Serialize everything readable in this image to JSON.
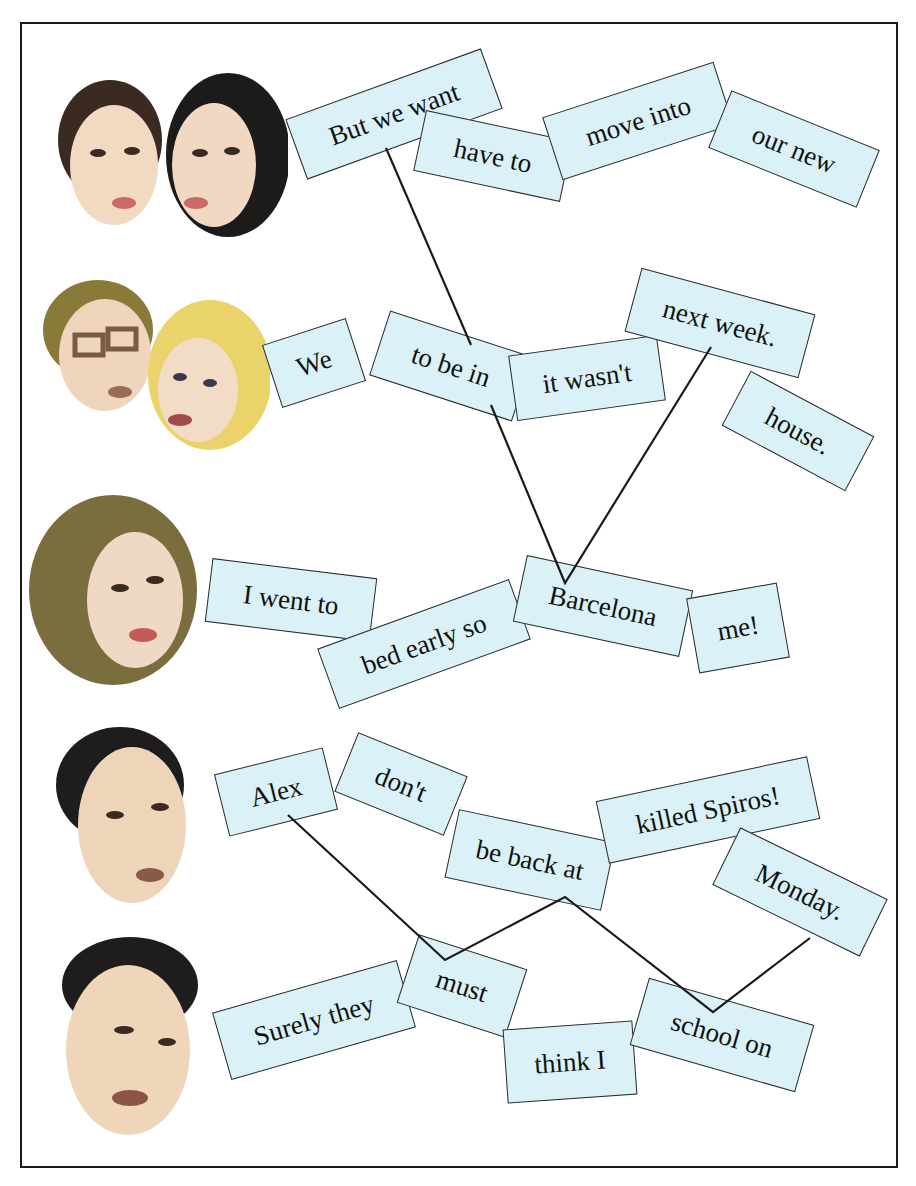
{
  "exercise": {
    "background_color": "#ffffff",
    "card_color": "#daf1f7",
    "line_color": "#1a1a1a"
  },
  "rows": [
    {
      "speakers": "two-people-dark-hair",
      "cards": [
        {
          "text": "But we want",
          "x": 290,
          "y": 82,
          "w": 208,
          "h": 64,
          "rot": -20
        },
        {
          "text": "have to",
          "x": 418,
          "y": 125,
          "w": 150,
          "h": 62,
          "rot": 12
        },
        {
          "text": "move into",
          "x": 548,
          "y": 88,
          "w": 180,
          "h": 66,
          "rot": -18
        },
        {
          "text": "our new",
          "x": 714,
          "y": 118,
          "w": 160,
          "h": 62,
          "rot": 22
        }
      ]
    },
    {
      "speakers": "man-with-glasses-and-blonde-woman",
      "cards": [
        {
          "text": "We",
          "x": 270,
          "y": 330,
          "w": 88,
          "h": 66,
          "rot": -18
        },
        {
          "text": "to be in",
          "x": 376,
          "y": 332,
          "w": 150,
          "h": 68,
          "rot": 18
        },
        {
          "text": "it wasn't",
          "x": 512,
          "y": 345,
          "w": 150,
          "h": 66,
          "rot": -8
        },
        {
          "text": "next week.",
          "x": 630,
          "y": 290,
          "w": 180,
          "h": 66,
          "rot": 15
        },
        {
          "text": "house.",
          "x": 728,
          "y": 400,
          "w": 140,
          "h": 62,
          "rot": 28
        }
      ]
    },
    {
      "speakers": "woman-brown-hair",
      "cards": [
        {
          "text": "I went to",
          "x": 208,
          "y": 568,
          "w": 166,
          "h": 64,
          "rot": 7
        },
        {
          "text": "bed early so",
          "x": 322,
          "y": 612,
          "w": 204,
          "h": 64,
          "rot": -20
        },
        {
          "text": "Barcelona",
          "x": 518,
          "y": 572,
          "w": 170,
          "h": 68,
          "rot": 12
        },
        {
          "text": "me!",
          "x": 692,
          "y": 590,
          "w": 92,
          "h": 76,
          "rot": -10
        }
      ]
    },
    {
      "speakers": "man-dark-hair-1",
      "cards": [
        {
          "text": "Alex",
          "x": 220,
          "y": 760,
          "w": 112,
          "h": 64,
          "rot": -14
        },
        {
          "text": "don't",
          "x": 342,
          "y": 752,
          "w": 118,
          "h": 64,
          "rot": 22
        },
        {
          "text": "be back at",
          "x": 450,
          "y": 825,
          "w": 160,
          "h": 70,
          "rot": 12
        },
        {
          "text": "killed Spiros!",
          "x": 600,
          "y": 778,
          "w": 216,
          "h": 64,
          "rot": -12
        },
        {
          "text": "Monday.",
          "x": 718,
          "y": 860,
          "w": 164,
          "h": 64,
          "rot": 26
        }
      ]
    },
    {
      "speakers": "man-dark-hair-2",
      "cards": [
        {
          "text": "Surely they",
          "x": 218,
          "y": 985,
          "w": 192,
          "h": 70,
          "rot": -16
        },
        {
          "text": "must",
          "x": 405,
          "y": 950,
          "w": 114,
          "h": 72,
          "rot": 18
        },
        {
          "text": "think I",
          "x": 505,
          "y": 1025,
          "w": 130,
          "h": 74,
          "rot": -4
        },
        {
          "text": "school on",
          "x": 636,
          "y": 1000,
          "w": 172,
          "h": 70,
          "rot": 16
        }
      ]
    }
  ],
  "connectors": [
    {
      "points": "386,148 471,345"
    },
    {
      "points": "491,405 565,583 711,347"
    },
    {
      "points": "288,815 445,960 565,897 713,1012 810,938"
    }
  ]
}
